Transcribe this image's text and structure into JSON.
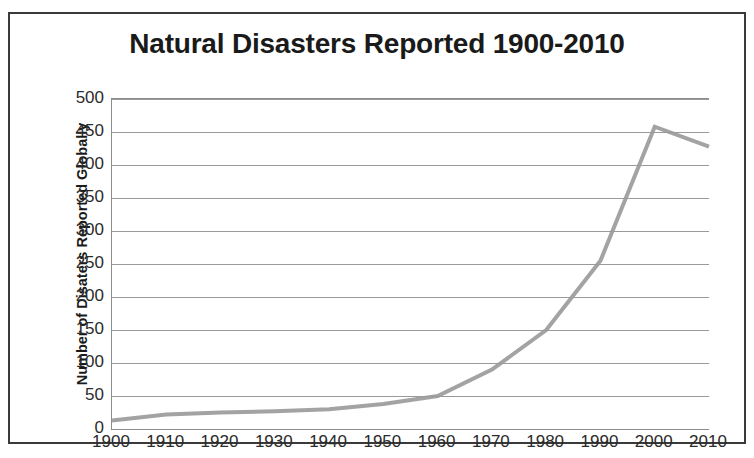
{
  "chart_data": {
    "type": "line",
    "title": "Natural Disasters Reported 1900-2010",
    "xlabel": "",
    "ylabel": "Number of Disaters Reported Globally",
    "categories": [
      "1900",
      "1910",
      "1920",
      "1930",
      "1940",
      "1950",
      "1960",
      "1970",
      "1980",
      "1990",
      "2000",
      "2010"
    ],
    "x": [
      1900,
      1910,
      1920,
      1930,
      1940,
      1950,
      1960,
      1970,
      1980,
      1990,
      2000,
      2010
    ],
    "values": [
      13,
      22,
      25,
      27,
      30,
      38,
      50,
      90,
      150,
      255,
      458,
      428
    ],
    "series": [
      {
        "name": "Natural disasters reported",
        "values": [
          13,
          22,
          25,
          27,
          30,
          38,
          50,
          90,
          150,
          255,
          458,
          428
        ],
        "color": "#a3a3a3"
      }
    ],
    "ylim": [
      0,
      500
    ],
    "ytick_values": [
      0,
      50,
      100,
      150,
      200,
      250,
      300,
      350,
      400,
      450,
      500
    ],
    "ytick_labels": [
      "0",
      "50",
      "100",
      "150",
      "200",
      "250",
      "300",
      "350",
      "400",
      "450",
      "500"
    ],
    "xlim": [
      1900,
      2010
    ],
    "grid": "horizontal",
    "legend": "none",
    "line_color": "#a3a3a3",
    "line_width": 4,
    "frame_color": "#3a3a3a",
    "background_color": "#ffffff",
    "text_color": "#1a1a1a"
  }
}
